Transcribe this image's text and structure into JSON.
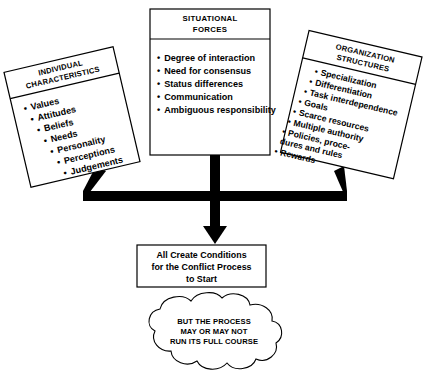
{
  "diagram": {
    "left_box": {
      "header_line1": "INDIVIDUAL",
      "header_line2": "CHARACTERISTICS",
      "items": [
        "Values",
        "Attitudes",
        "Beliefs",
        "Needs",
        "Personality",
        "Perceptions",
        "Judgements"
      ]
    },
    "center_box": {
      "header_line1": "SITUATIONAL",
      "header_line2": "FORCES",
      "items": [
        "Degree of interaction",
        "Need for consensus",
        "Status differences",
        "Communication",
        "Ambiguous responsibility"
      ]
    },
    "right_box": {
      "header_line1": "ORGANIZATION",
      "header_line2": "STRUCTURES",
      "items": [
        "Specialization",
        "Differentiation",
        "Task interdependence",
        "Goals",
        "Scarce resources",
        "Multiple authority",
        "Policies, proce-",
        "dures and rules",
        "Rewards"
      ]
    },
    "result_box": {
      "line1": "All Create Conditions",
      "line2": "for the Conflict Process",
      "line3": "to Start"
    },
    "cloud": {
      "line1": "BUT THE PROCESS",
      "line2": "MAY OR MAY NOT",
      "line3": "RUN ITS FULL COURSE"
    },
    "bullet_glyph": "•",
    "colors": {
      "stroke": "#000000",
      "fill": "#ffffff",
      "connector": "#000000"
    }
  }
}
